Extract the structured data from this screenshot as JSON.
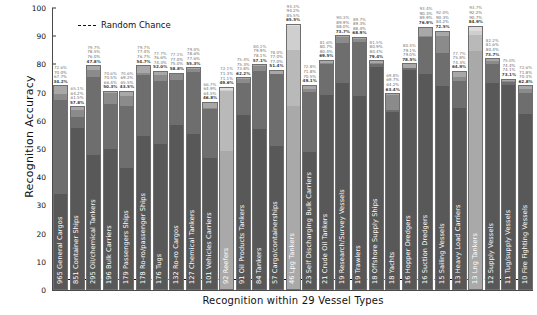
{
  "chart_data": {
    "type": "bar",
    "title": "",
    "xlabel": "Recognition within 29 Vessel Types",
    "ylabel": "Recognition Accuracy",
    "ylim": [
      0,
      100
    ],
    "yticks": [
      "0",
      "10",
      "20",
      "30",
      "40",
      "50",
      "60",
      "70",
      "80",
      "90",
      "100"
    ],
    "grid": false,
    "legend": [
      {
        "label": "Random Chance",
        "style": "dashed-line"
      }
    ],
    "random_chance": 3.4,
    "stacked": true,
    "series_note": "Each bar is a stacked set of 4 cumulative accuracy values; labels above bar list all four.",
    "categories": [
      "965 General Cargos",
      "851 Container Ships",
      "295 Oil/chemical Tankers",
      "196 Bulk Carriers",
      "179 Passengers Ships",
      "178 Ro-ro/passenger Ships",
      "176 Tugs",
      "132 Ro-ro Cargos",
      "127 Chemical Tankers",
      "101 Vehicles Carriers",
      "92 Reefers",
      "91 Oil Products Tankers",
      "84 Tankers",
      "57 Cargo/containerships",
      "46 Lpg Tankers",
      "23 Self Discharging Bulk Carriers",
      "21 Crude Oil Tankers",
      "19 Research/Survey Vessels",
      "19 Trawlers",
      "18 Offshore Supply Ships",
      "18 Yachts",
      "16 Hopper Dredgers",
      "16 Suction Dredgers",
      "15 Sailing Vessels",
      "13 Heavy Load Carriers",
      "13 Lng Tankers",
      "12 Supply Vessels",
      "11 Tug/supply Vessels",
      "10 Fire Fighting Vessels"
    ],
    "bars": [
      {
        "values": [
          34.2,
          67.7,
          70.0,
          72.6
        ],
        "light": false
      },
      {
        "values": [
          57.8,
          61.5,
          64.2,
          65.1
        ],
        "light": false
      },
      {
        "values": [
          47.8,
          76.0,
          78.5,
          79.7
        ],
        "light": false
      },
      {
        "values": [
          50.3,
          66.4,
          70.5,
          70.6
        ],
        "light": false
      },
      {
        "values": [
          43.5,
          65.5,
          69.2,
          70.6
        ],
        "light": false
      },
      {
        "values": [
          54.7,
          76.7,
          77.4,
          79.7
        ],
        "light": false
      },
      {
        "values": [
          52.0,
          74.3,
          76.6,
          77.7
        ],
        "light": false
      },
      {
        "values": [
          58.8,
          75.0,
          77.0,
          77.1
        ],
        "light": false
      },
      {
        "values": [
          55.3,
          77.6,
          78.6,
          79.0
        ],
        "light": false
      },
      {
        "values": [
          46.8,
          64.5,
          64.9,
          66.7
        ],
        "light": false
      },
      {
        "values": [
          49.6,
          71.1,
          71.3,
          72.1
        ],
        "light": true
      },
      {
        "values": [
          62.2,
          73.8,
          75.3,
          75.4
        ],
        "light": false
      },
      {
        "values": [
          57.1,
          78.1,
          79.9,
          80.1
        ],
        "light": false
      },
      {
        "values": [
          51.4,
          78.0,
          77.0,
          77.0
        ],
        "light": false
      },
      {
        "values": [
          65.5,
          85.5,
          94.2,
          94.3
        ],
        "light": true
      },
      {
        "values": [
          49.1,
          70.5,
          71.8,
          72.8
        ],
        "light": false
      },
      {
        "values": [
          69.5,
          80.4,
          80.7,
          81.6
        ],
        "light": false
      },
      {
        "values": [
          73.7,
          88.0,
          89.9,
          90.3
        ],
        "light": false
      },
      {
        "values": [
          68.9,
          88.4,
          89.3,
          89.7
        ],
        "light": false
      },
      {
        "values": [
          79.4,
          80.4,
          80.9,
          81.5
        ],
        "light": false
      },
      {
        "values": [
          63.4,
          64.2,
          69.8,
          69.7
        ],
        "light": false
      },
      {
        "values": [
          79.0,
          78.5,
          79.1,
          80.4
        ],
        "light": false
      },
      {
        "values": [
          76.9,
          89.9,
          90.3,
          93.4
        ],
        "light": false
      },
      {
        "values": [
          72.5,
          84.2,
          90.3,
          92.0
        ],
        "light": false
      },
      {
        "values": [
          64.9,
          74.3,
          75.8,
          77.7
        ],
        "light": false
      },
      {
        "values": [
          84.9,
          90.7,
          92.2,
          93.7
        ],
        "light": true
      },
      {
        "values": [
          73.7,
          80.4,
          81.6,
          82.2
        ],
        "light": false
      },
      {
        "values": [
          73.1,
          74.1,
          74.4,
          75.0
        ],
        "light": false
      },
      {
        "values": [
          62.8,
          70.3,
          71.8,
          72.6
        ],
        "light": false
      }
    ]
  }
}
